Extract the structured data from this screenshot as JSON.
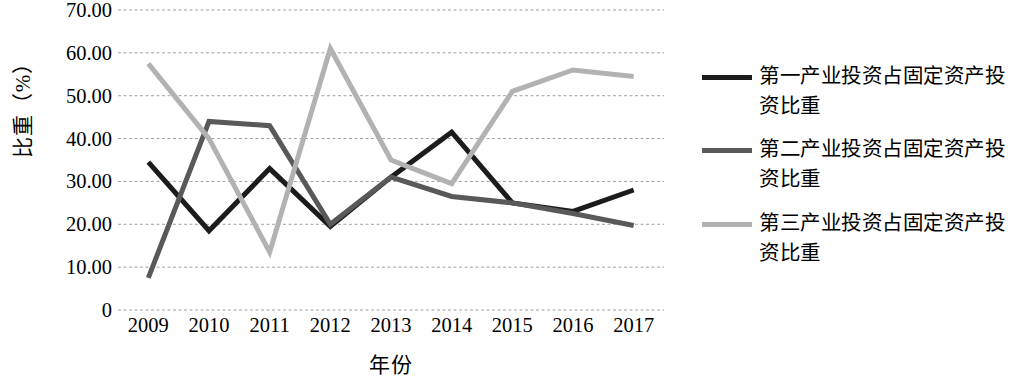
{
  "chart_data": {
    "type": "line",
    "title": "",
    "xlabel": "年份",
    "ylabel": "比重（%）",
    "categories": [
      "2009",
      "2010",
      "2011",
      "2012",
      "2013",
      "2014",
      "2015",
      "2016",
      "2017"
    ],
    "ylim": [
      0,
      70
    ],
    "ytick_labels": [
      "70.00",
      "60.00",
      "50.00",
      "40.00",
      "30.00",
      "20.00",
      "10.00",
      "0"
    ],
    "ytick_values": [
      70,
      60,
      50,
      40,
      30,
      20,
      10,
      0
    ],
    "grid": true,
    "grid_style": "dotted-horizontal",
    "legend_position": "right",
    "series": [
      {
        "name": "第一产业投资占固定资产投资比重",
        "color": "#1c1c1c",
        "values": [
          34.5,
          18.5,
          33.0,
          19.5,
          31.0,
          41.5,
          25.0,
          23.0,
          28.0
        ]
      },
      {
        "name": "第二产业投资占固定资产投资比重",
        "color": "#595959",
        "values": [
          7.5,
          44.0,
          43.0,
          20.0,
          31.0,
          26.5,
          25.0,
          22.5,
          19.7
        ]
      },
      {
        "name": "第三产业投资占固定资产投资比重",
        "color": "#b2b2b2",
        "values": [
          57.5,
          40.0,
          13.5,
          61.0,
          35.0,
          29.5,
          51.0,
          56.0,
          54.5
        ]
      }
    ]
  },
  "axis": {
    "y_title": "比重（%）",
    "x_title": "年份"
  },
  "legend": {
    "items": [
      {
        "label": "第一产业投资占固定资产投资比重",
        "color": "#1c1c1c"
      },
      {
        "label": "第二产业投资占固定资产投资比重",
        "color": "#595959"
      },
      {
        "label": "第三产业投资占固定资产投资比重",
        "color": "#b2b2b2"
      }
    ]
  }
}
